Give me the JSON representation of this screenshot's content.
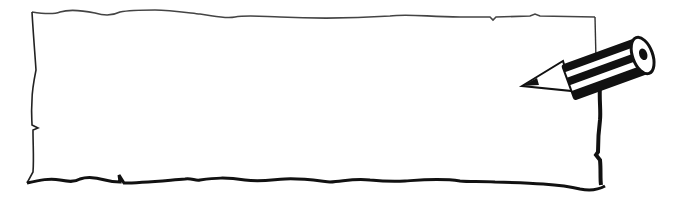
{
  "image": {
    "description": "Hand-drawn blank paper note frame with a pencil",
    "background": "#ffffff",
    "stroke_color": "#111111",
    "frame_text": "",
    "icons": [
      "paper-frame-icon",
      "pencil-icon"
    ]
  }
}
